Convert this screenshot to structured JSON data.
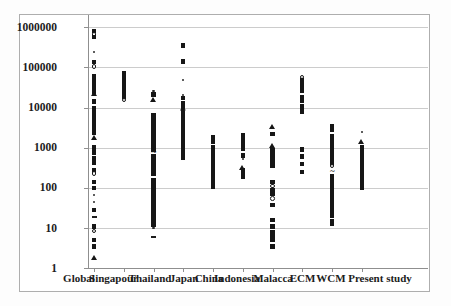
{
  "colors": {
    "marker": "#161616",
    "gridline": "#cccccc",
    "axis": "#8f8f8f",
    "figure_border": "#aeaeae",
    "background": "#ffffff"
  },
  "chart_data": {
    "type": "scatter",
    "title": "",
    "xlabel": "",
    "ylabel": "",
    "y_scale": "log",
    "ylim": [
      1,
      1000000
    ],
    "grid": "horizontal-decades",
    "legend": "none",
    "y_tick_labels": [
      "1000000",
      "100000",
      "10000",
      "1000",
      "100",
      "10",
      "1"
    ],
    "y_tick_values": [
      1000000,
      100000,
      10000,
      1000,
      100,
      10,
      1
    ],
    "categories": [
      "Global",
      "Singapour",
      "Thailand",
      "Japan",
      "China",
      "Indonesia",
      "Malacca",
      "ECM",
      "WCM",
      "Present study"
    ],
    "marker_legend": {
      "sq": "filled-square",
      "tr": "filled-triangle",
      "ci": "open-circle",
      "dot": "small-dot",
      "da": "dash",
      "di": "diamond",
      "tl": "tilde"
    },
    "series": [
      {
        "name": "Global",
        "points": [
          [
            800000,
            "sq"
          ],
          [
            650000,
            "ci"
          ],
          [
            560000,
            "sq"
          ],
          [
            240000,
            "dot"
          ],
          [
            135000,
            "sq"
          ],
          [
            105000,
            "ci"
          ],
          [
            60000,
            "sq"
          ],
          [
            52000,
            "sq"
          ],
          [
            46000,
            "sq"
          ],
          [
            40000,
            "sq"
          ],
          [
            36000,
            "sq"
          ],
          [
            32000,
            "sq"
          ],
          [
            28000,
            "sq"
          ],
          [
            25000,
            "sq"
          ],
          [
            22000,
            "tr"
          ],
          [
            14000,
            "sq"
          ],
          [
            9500,
            "sq"
          ],
          [
            8500,
            "sq"
          ],
          [
            7600,
            "sq"
          ],
          [
            6800,
            "sq"
          ],
          [
            6000,
            "sq"
          ],
          [
            5300,
            "sq"
          ],
          [
            4700,
            "sq"
          ],
          [
            4100,
            "sq"
          ],
          [
            3600,
            "sq"
          ],
          [
            3100,
            "sq"
          ],
          [
            2700,
            "sq"
          ],
          [
            2300,
            "sq"
          ],
          [
            1800,
            "tr"
          ],
          [
            1050,
            "sq"
          ],
          [
            900,
            "sq"
          ],
          [
            750,
            "sq"
          ],
          [
            560,
            "sq"
          ],
          [
            430,
            "sq"
          ],
          [
            270,
            "sq"
          ],
          [
            225,
            "ci"
          ],
          [
            140,
            "sq"
          ],
          [
            100,
            "sq"
          ],
          [
            65,
            "dot"
          ],
          [
            45,
            "dot"
          ],
          [
            28,
            "sq"
          ],
          [
            19,
            "da"
          ],
          [
            11,
            "sq"
          ],
          [
            8.5,
            "ci"
          ],
          [
            5,
            "sq"
          ],
          [
            3.5,
            "sq"
          ],
          [
            1.8,
            "tr"
          ]
        ]
      },
      {
        "name": "Singapour",
        "points": [
          [
            70000,
            "sq"
          ],
          [
            61000,
            "sq"
          ],
          [
            53000,
            "sq"
          ],
          [
            46000,
            "sq"
          ],
          [
            40000,
            "sq"
          ],
          [
            35000,
            "sq"
          ],
          [
            30000,
            "sq"
          ],
          [
            26000,
            "sq"
          ],
          [
            22000,
            "sq"
          ],
          [
            18000,
            "sq"
          ],
          [
            15500,
            "ci"
          ]
        ]
      },
      {
        "name": "Thailand",
        "points": [
          [
            26000,
            "dot"
          ],
          [
            21000,
            "sq"
          ],
          [
            15500,
            "tr"
          ],
          [
            6500,
            "sq"
          ],
          [
            5000,
            "sq"
          ],
          [
            4400,
            "sq"
          ],
          [
            3900,
            "sq"
          ],
          [
            3400,
            "sq"
          ],
          [
            3000,
            "sq"
          ],
          [
            2600,
            "sq"
          ],
          [
            2250,
            "sq"
          ],
          [
            1950,
            "sq"
          ],
          [
            1700,
            "sq"
          ],
          [
            1450,
            "sq"
          ],
          [
            1250,
            "sq"
          ],
          [
            1050,
            "sq"
          ],
          [
            900,
            "sq"
          ],
          [
            770,
            "tl"
          ],
          [
            615,
            "sq"
          ],
          [
            540,
            "sq"
          ],
          [
            470,
            "sq"
          ],
          [
            410,
            "sq"
          ],
          [
            355,
            "sq"
          ],
          [
            305,
            "sq"
          ],
          [
            260,
            "sq"
          ],
          [
            220,
            "sq"
          ],
          [
            160,
            "sq"
          ],
          [
            135,
            "sq"
          ],
          [
            115,
            "sq"
          ],
          [
            97,
            "sq"
          ],
          [
            82,
            "sq"
          ],
          [
            68,
            "sq"
          ],
          [
            57,
            "sq"
          ],
          [
            47,
            "sq"
          ],
          [
            39,
            "sq"
          ],
          [
            32,
            "sq"
          ],
          [
            27,
            "sq"
          ],
          [
            23,
            "sq"
          ],
          [
            19,
            "sq"
          ],
          [
            15,
            "sq"
          ],
          [
            12,
            "sq"
          ],
          [
            10,
            "dot"
          ],
          [
            6,
            "da"
          ]
        ]
      },
      {
        "name": "Japan",
        "points": [
          [
            350000,
            "sq"
          ],
          [
            140000,
            "sq"
          ],
          [
            48000,
            "dot"
          ],
          [
            20000,
            "dot"
          ],
          [
            17000,
            "sq"
          ],
          [
            12500,
            "sq"
          ],
          [
            10500,
            "sq"
          ],
          [
            8800,
            "di"
          ],
          [
            7300,
            "sq"
          ],
          [
            6200,
            "sq"
          ],
          [
            5300,
            "sq"
          ],
          [
            4500,
            "sq"
          ],
          [
            3800,
            "sq"
          ],
          [
            3200,
            "sq"
          ],
          [
            2700,
            "sq"
          ],
          [
            2300,
            "sq"
          ],
          [
            1950,
            "sq"
          ],
          [
            1550,
            "sq"
          ],
          [
            1280,
            "sq"
          ],
          [
            1050,
            "sq"
          ],
          [
            870,
            "sq"
          ],
          [
            700,
            "sq"
          ],
          [
            560,
            "sq"
          ]
        ]
      },
      {
        "name": "China",
        "points": [
          [
            1800,
            "sq"
          ],
          [
            1400,
            "sq"
          ],
          [
            1020,
            "sq"
          ],
          [
            900,
            "sq"
          ],
          [
            800,
            "sq"
          ],
          [
            710,
            "sq"
          ],
          [
            630,
            "sq"
          ],
          [
            560,
            "sq"
          ],
          [
            500,
            "sq"
          ],
          [
            440,
            "sq"
          ],
          [
            390,
            "sq"
          ],
          [
            345,
            "sq"
          ],
          [
            300,
            "sq"
          ],
          [
            260,
            "sq"
          ],
          [
            225,
            "sq"
          ],
          [
            195,
            "sq"
          ],
          [
            168,
            "sq"
          ],
          [
            145,
            "sq"
          ],
          [
            125,
            "sq"
          ],
          [
            108,
            "sq"
          ]
        ]
      },
      {
        "name": "Indonesia",
        "points": [
          [
            2100,
            "sq"
          ],
          [
            1700,
            "sq"
          ],
          [
            1400,
            "sq"
          ],
          [
            1150,
            "sq"
          ],
          [
            950,
            "sq"
          ],
          [
            640,
            "sq"
          ],
          [
            520,
            "dot"
          ],
          [
            330,
            "tr"
          ],
          [
            270,
            "sq"
          ],
          [
            220,
            "sq"
          ],
          [
            185,
            "sq"
          ]
        ]
      },
      {
        "name": "Malacca",
        "points": [
          [
            3400,
            "tr"
          ],
          [
            2200,
            "sq"
          ],
          [
            1100,
            "tr"
          ],
          [
            850,
            "sq"
          ],
          [
            700,
            "sq"
          ],
          [
            590,
            "sq"
          ],
          [
            500,
            "sq"
          ],
          [
            420,
            "sq"
          ],
          [
            350,
            "sq"
          ],
          [
            140,
            "sq"
          ],
          [
            110,
            "ci"
          ],
          [
            90,
            "sq"
          ],
          [
            70,
            "sq"
          ],
          [
            55,
            "ci"
          ],
          [
            38,
            "sq"
          ],
          [
            16,
            "sq"
          ],
          [
            11,
            "sq"
          ],
          [
            8,
            "sq"
          ],
          [
            6.5,
            "sq"
          ],
          [
            5,
            "sq"
          ],
          [
            3.5,
            "sq"
          ]
        ]
      },
      {
        "name": "ECM",
        "points": [
          [
            58000,
            "ci"
          ],
          [
            47000,
            "sq"
          ],
          [
            38000,
            "sq"
          ],
          [
            31000,
            "sq"
          ],
          [
            26000,
            "sq"
          ],
          [
            18500,
            "sq"
          ],
          [
            14500,
            "sq"
          ],
          [
            10500,
            "sq"
          ],
          [
            8000,
            "sq"
          ],
          [
            900,
            "sq"
          ],
          [
            600,
            "sq"
          ],
          [
            400,
            "sq"
          ],
          [
            250,
            "sq"
          ]
        ]
      },
      {
        "name": "WCM",
        "points": [
          [
            3400,
            "sq"
          ],
          [
            2800,
            "sq"
          ],
          [
            1950,
            "sq"
          ],
          [
            1550,
            "sq"
          ],
          [
            1230,
            "sq"
          ],
          [
            950,
            "sq"
          ],
          [
            800,
            "sq"
          ],
          [
            670,
            "sq"
          ],
          [
            560,
            "sq"
          ],
          [
            470,
            "sq"
          ],
          [
            400,
            "sq"
          ],
          [
            355,
            "ci"
          ],
          [
            265,
            "tl"
          ],
          [
            200,
            "sq"
          ],
          [
            170,
            "sq"
          ],
          [
            145,
            "sq"
          ],
          [
            123,
            "sq"
          ],
          [
            104,
            "sq"
          ],
          [
            88,
            "sq"
          ],
          [
            74,
            "sq"
          ],
          [
            62,
            "sq"
          ],
          [
            52,
            "sq"
          ],
          [
            44,
            "sq"
          ],
          [
            37,
            "sq"
          ],
          [
            31,
            "sq"
          ],
          [
            26,
            "sq"
          ],
          [
            20,
            "sq"
          ],
          [
            15,
            "sq"
          ],
          [
            12.5,
            "sq"
          ]
        ]
      },
      {
        "name": "Present study",
        "points": [
          [
            2500,
            "dot"
          ],
          [
            1400,
            "tr"
          ],
          [
            1020,
            "sq"
          ],
          [
            900,
            "sq"
          ],
          [
            800,
            "sq"
          ],
          [
            700,
            "sq"
          ],
          [
            610,
            "sq"
          ],
          [
            530,
            "sq"
          ],
          [
            460,
            "sq"
          ],
          [
            400,
            "sq"
          ],
          [
            350,
            "sq"
          ],
          [
            300,
            "sq"
          ],
          [
            255,
            "sq"
          ],
          [
            215,
            "sq"
          ],
          [
            180,
            "sq"
          ],
          [
            150,
            "sq"
          ],
          [
            125,
            "sq"
          ],
          [
            100,
            "sq"
          ]
        ]
      }
    ]
  }
}
